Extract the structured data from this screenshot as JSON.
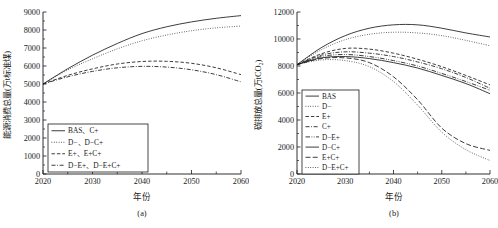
{
  "figure": {
    "panels": [
      {
        "caption": "(a)",
        "xlabel": "年份",
        "ylabel": "能源消费总量(万t标准煤)",
        "xticks": [
          "2020",
          "2030",
          "2040",
          "2050",
          "2060"
        ],
        "yticks": [
          "0",
          "1000",
          "2000",
          "3000",
          "4000",
          "5000",
          "6000",
          "7000",
          "8000",
          "9000"
        ],
        "legend": [
          {
            "label": "BAS、C+",
            "style": "solid"
          },
          {
            "label": "D−、D−C+",
            "style": "dotted"
          },
          {
            "label": "E+、E+C+",
            "style": "dashed"
          },
          {
            "label": "D−E+、D−E+C+",
            "style": "dashdot"
          }
        ]
      },
      {
        "caption": "(b)",
        "xlabel": "年份",
        "ylabel": "碳排放总量(万tCO₂)",
        "xticks": [
          "2020",
          "2030",
          "2040",
          "2050",
          "2060"
        ],
        "yticks": [
          "0",
          "2000",
          "4000",
          "6000",
          "8000",
          "10000",
          "12000"
        ],
        "legend": [
          {
            "label": "BAS",
            "style": "solid"
          },
          {
            "label": "D−",
            "style": "dotted"
          },
          {
            "label": "E+",
            "style": "dashed"
          },
          {
            "label": "C+",
            "style": "dashdot"
          },
          {
            "label": "D−E+",
            "style": "dashdotdot"
          },
          {
            "label": "D−C+",
            "style": "solid"
          },
          {
            "label": "E+C+",
            "style": "longdash"
          },
          {
            "label": "D−E+C+",
            "style": "dotted"
          }
        ]
      }
    ]
  },
  "chart_data": [
    {
      "type": "line",
      "title": "",
      "subtitle": "(a)",
      "xlabel": "年份",
      "ylabel": "能源消费总量(万t标准煤)",
      "xlim": [
        2020,
        2060
      ],
      "ylim": [
        0,
        9000
      ],
      "xticks": [
        2020,
        2030,
        2040,
        2050,
        2060
      ],
      "yticks": [
        0,
        1000,
        2000,
        3000,
        4000,
        5000,
        6000,
        7000,
        8000,
        9000
      ],
      "grid": false,
      "legend_position": "lower-left",
      "x": [
        2020,
        2025,
        2030,
        2035,
        2040,
        2045,
        2050,
        2055,
        2060
      ],
      "series": [
        {
          "name": "BAS、C+",
          "style": "solid",
          "values": [
            5000,
            5850,
            6600,
            7250,
            7800,
            8180,
            8450,
            8650,
            8800
          ]
        },
        {
          "name": "D−、D−C+",
          "style": "dotted",
          "values": [
            5000,
            5780,
            6400,
            6950,
            7400,
            7720,
            7960,
            8120,
            8220
          ]
        },
        {
          "name": "E+、E+C+",
          "style": "dashed",
          "values": [
            5000,
            5480,
            5840,
            6110,
            6250,
            6260,
            6150,
            5900,
            5520
          ]
        },
        {
          "name": "D−E+、D−E+C+",
          "style": "dashdot",
          "values": [
            5000,
            5400,
            5700,
            5900,
            5980,
            5940,
            5790,
            5520,
            5120
          ]
        }
      ]
    },
    {
      "type": "line",
      "title": "",
      "subtitle": "(b)",
      "xlabel": "年份",
      "ylabel": "碳排放总量(万tCO₂)",
      "xlim": [
        2020,
        2060
      ],
      "ylim": [
        0,
        12000
      ],
      "xticks": [
        2020,
        2030,
        2040,
        2050,
        2060
      ],
      "yticks": [
        0,
        2000,
        4000,
        6000,
        8000,
        10000,
        12000
      ],
      "grid": false,
      "legend_position": "lower-left",
      "x": [
        2020,
        2025,
        2030,
        2035,
        2040,
        2045,
        2050,
        2055,
        2060
      ],
      "series": [
        {
          "name": "BAS",
          "style": "solid",
          "values": [
            8100,
            9350,
            10250,
            10800,
            11050,
            11050,
            10800,
            10450,
            10150
          ]
        },
        {
          "name": "D−",
          "style": "dotted",
          "values": [
            8100,
            9200,
            9950,
            10350,
            10500,
            10450,
            10250,
            9900,
            9500
          ]
        },
        {
          "name": "E+",
          "style": "dashed",
          "values": [
            8100,
            8900,
            9300,
            9250,
            8950,
            8500,
            7950,
            7300,
            6600
          ]
        },
        {
          "name": "C+",
          "style": "dashdot",
          "values": [
            8100,
            8800,
            9050,
            8950,
            8700,
            8300,
            7800,
            7150,
            6350
          ]
        },
        {
          "name": "D−E+",
          "style": "dashdotdot",
          "values": [
            8100,
            8700,
            8850,
            8700,
            8400,
            8000,
            7450,
            6850,
            6200
          ]
        },
        {
          "name": "D−C+",
          "style": "solid",
          "values": [
            8100,
            8600,
            8700,
            8550,
            8250,
            7850,
            7300,
            6700,
            5950
          ]
        },
        {
          "name": "E+C+",
          "style": "longdash",
          "values": [
            8100,
            8550,
            8600,
            8250,
            7200,
            5500,
            3400,
            2250,
            1750
          ]
        },
        {
          "name": "D−E+C+",
          "style": "dotted",
          "values": [
            8100,
            8450,
            8400,
            7950,
            6850,
            5100,
            3100,
            1800,
            1000
          ]
        }
      ]
    }
  ]
}
